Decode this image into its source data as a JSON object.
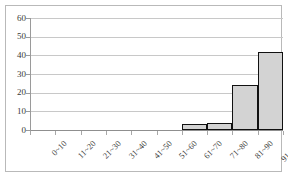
{
  "chart_data": {
    "type": "bar",
    "title": "",
    "subtitle": "",
    "xlabel": "",
    "ylabel": "",
    "categories": [
      "0~10",
      "11~20",
      "21~30",
      "31~40",
      "41~50",
      "51~60",
      "61~70",
      "71~80",
      "81~90",
      "91~100"
    ],
    "values": [
      0,
      0,
      0,
      0,
      0,
      0,
      3,
      4,
      24,
      42
    ],
    "ylim": [
      0,
      60
    ],
    "yticks": [
      0,
      10,
      20,
      30,
      40,
      50,
      60
    ],
    "ytick_labels": [
      "0",
      "10",
      "20",
      "30",
      "40",
      "50",
      "60"
    ],
    "grid": true,
    "legend": false,
    "legend_position": "none",
    "bar_fill_color": "#d3d3d3",
    "bar_border_color": "#111111",
    "gridline_color": "#c8c8c8",
    "axis_color": "#9a9a9a",
    "frame_color": "#b9b9b9",
    "background_color": "#ffffff",
    "text_color": "#3a3a3a"
  }
}
